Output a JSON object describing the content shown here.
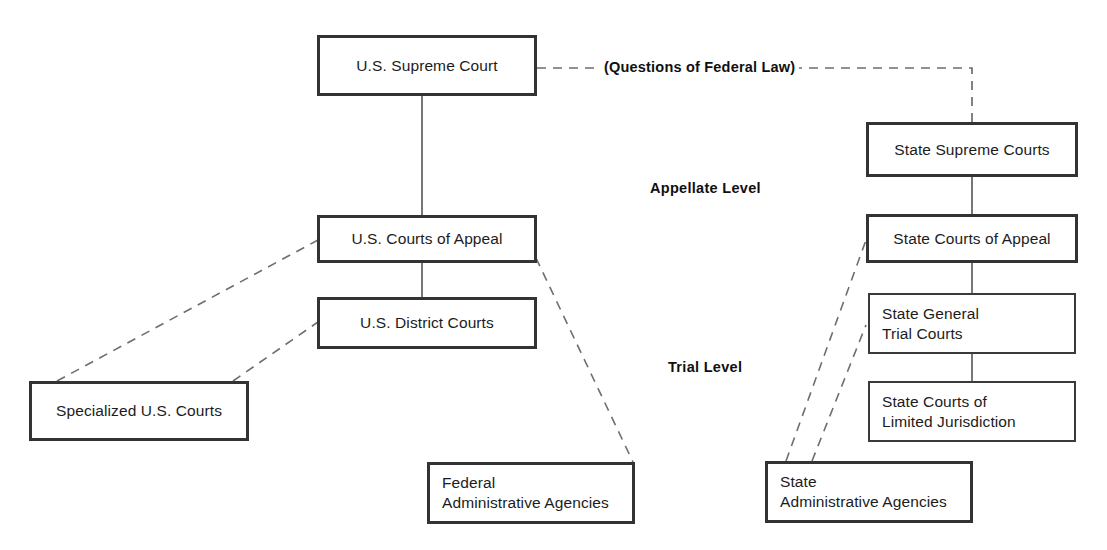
{
  "diagram": {
    "line_color": "#2b2b2b",
    "dash_color": "#6e6e6e",
    "background": "#ffffff"
  },
  "federal_nodes": [
    {
      "id": "us-supreme-court",
      "label": "U.S. Supreme Court"
    },
    {
      "id": "us-courts-of-appeal",
      "label": "U.S. Courts of Appeal"
    },
    {
      "id": "us-district-courts",
      "label": "U.S. District Courts"
    },
    {
      "id": "specialized-us-courts",
      "label": "Specialized U.S. Courts"
    },
    {
      "id": "federal-administrative-agencies",
      "label": "Federal\nAdministrative Agencies"
    }
  ],
  "state_nodes": [
    {
      "id": "state-supreme-courts",
      "label": "State Supreme Courts"
    },
    {
      "id": "state-courts-of-appeal",
      "label": "State Courts of Appeal"
    },
    {
      "id": "state-general-trial-courts",
      "label": "State General\nTrial Courts"
    },
    {
      "id": "state-courts-limited-jurisdiction",
      "label": "State Courts of\nLimited Jurisdiction"
    },
    {
      "id": "state-administrative-agencies",
      "label": "State\nAdministrative Agencies"
    }
  ],
  "level_labels": [
    {
      "id": "appellate-level",
      "label": "Appellate Level"
    },
    {
      "id": "trial-level",
      "label": "Trial Level"
    }
  ],
  "edge_labels": [
    {
      "id": "questions-of-federal-law",
      "label": "(Questions of Federal Law)"
    }
  ]
}
